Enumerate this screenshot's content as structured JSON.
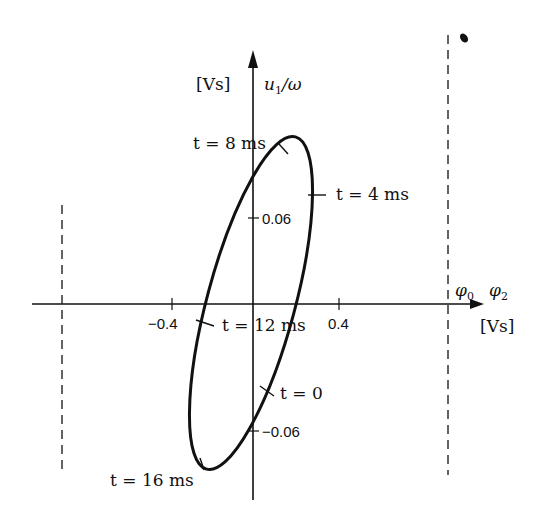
{
  "figure": {
    "y_axis": {
      "unit": "[Vs]",
      "label_var": "u",
      "label_sub": "1",
      "label_rest": "/ω"
    },
    "x_axis": {
      "unit": "[Vs]",
      "label_phi0": "φ",
      "label_phi0_sub": "0",
      "label_phi2": "φ",
      "label_phi2_sub": "2"
    },
    "ticks": {
      "x_neg": "−0.4",
      "x_pos": "0.4",
      "y_pos": "0.06",
      "y_neg": "−0.06"
    },
    "annotations": [
      {
        "id": "t8",
        "text": "t = 8 ms"
      },
      {
        "id": "t4",
        "text": "t = 4 ms"
      },
      {
        "id": "t12",
        "text": "t = 12 ms"
      },
      {
        "id": "t0",
        "text": "t = 0"
      },
      {
        "id": "t16",
        "text": "t = 16 ms"
      }
    ],
    "colors": {
      "ink": "#111111",
      "background": "#ffffff"
    }
  }
}
